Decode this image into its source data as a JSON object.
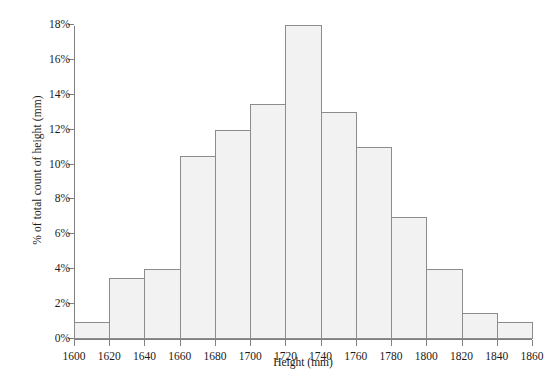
{
  "chart_data": {
    "type": "bar",
    "title": "",
    "subtitle": "",
    "xlabel": "Height (mm)",
    "ylabel": "% of total count of height (mm)",
    "xlim": [
      1600,
      1860
    ],
    "ylim": [
      0,
      18
    ],
    "grid": false,
    "legend": "none",
    "bin_width": 20,
    "x_tick_labels": [
      "1600",
      "1620",
      "1640",
      "1660",
      "1680",
      "1700",
      "1720",
      "1740",
      "1760",
      "1780",
      "1800",
      "1820",
      "1840",
      "1860"
    ],
    "x_tick_values": [
      1600,
      1620,
      1640,
      1660,
      1680,
      1700,
      1720,
      1740,
      1760,
      1780,
      1800,
      1820,
      1840,
      1860
    ],
    "y_tick_labels": [
      "0%",
      "2%",
      "4%",
      "6%",
      "8%",
      "10%",
      "12%",
      "14%",
      "16%",
      "18%"
    ],
    "y_tick_values": [
      0,
      2,
      4,
      6,
      8,
      10,
      12,
      14,
      16,
      18
    ],
    "categories": [
      "1600-1620",
      "1620-1640",
      "1640-1660",
      "1660-1680",
      "1680-1700",
      "1700-1720",
      "1720-1740",
      "1740-1760",
      "1760-1780",
      "1780-1800",
      "1800-1820",
      "1820-1840",
      "1840-1860"
    ],
    "bin_starts": [
      1600,
      1620,
      1640,
      1660,
      1680,
      1700,
      1720,
      1740,
      1760,
      1780,
      1800,
      1820,
      1840
    ],
    "bin_ends": [
      1620,
      1640,
      1660,
      1680,
      1700,
      1720,
      1740,
      1760,
      1780,
      1800,
      1820,
      1840,
      1860
    ],
    "values": [
      1,
      3.5,
      4,
      10.5,
      12,
      13.5,
      18,
      13,
      11,
      7,
      4,
      1.5,
      1
    ],
    "value_labels": [
      "1%",
      "3.5%",
      "4%",
      "10.5%",
      "12%",
      "13.5%",
      "18%",
      "13%",
      "11%",
      "7%",
      "4%",
      "1.5%",
      "1%"
    ]
  },
  "style": {
    "bar_fill": "#f2f2f2",
    "bar_edge": "#8c8c8c",
    "axis_color": "#808080",
    "text_color": "#1a1a1a",
    "background": "#ffffff"
  }
}
